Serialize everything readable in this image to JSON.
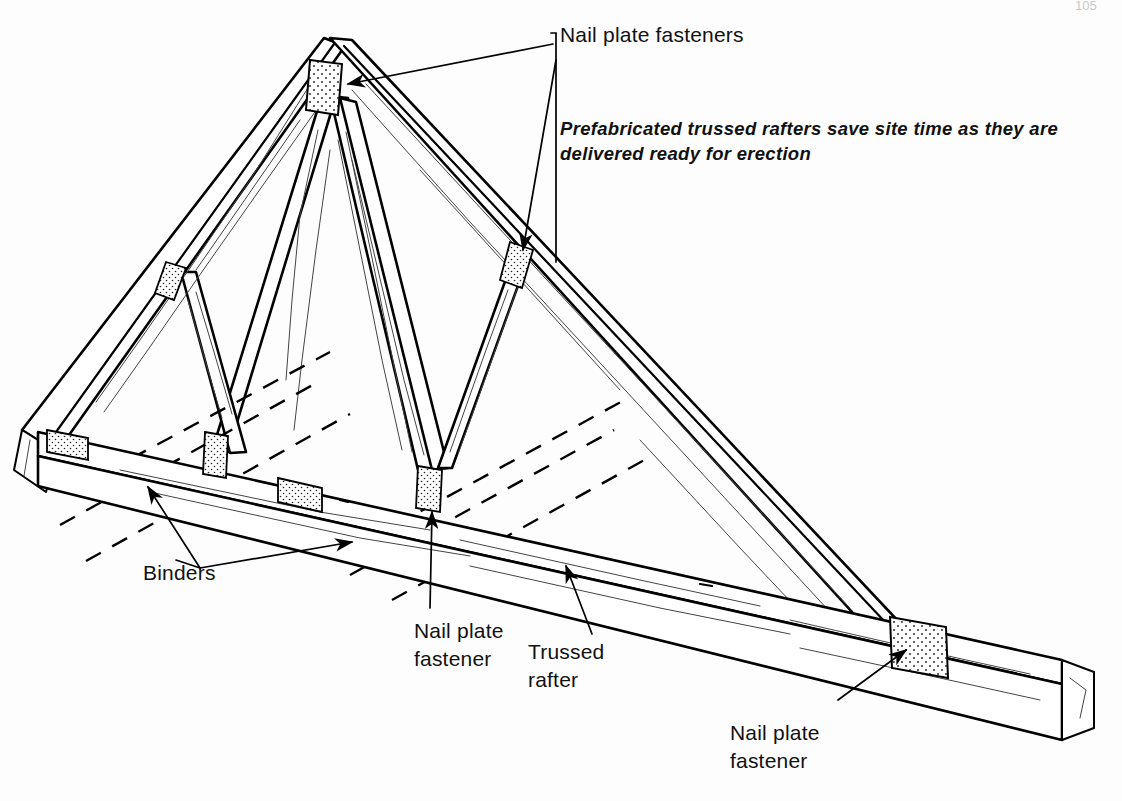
{
  "figure": {
    "page_number": "105",
    "line_color": "#000000",
    "background_color": "#ffffff",
    "grain_color": "#444444"
  },
  "caption": {
    "line1": "Prefabricated trussed rafters save site time as they are",
    "line2": "delivered ready for erection"
  },
  "labels": {
    "nail_plate_fasteners_top": "Nail plate fasteners",
    "binders": "Binders",
    "nail_plate_fastener_center_line1": "Nail plate",
    "nail_plate_fastener_center_line2": "fastener",
    "trussed_rafter_line1": "Trussed",
    "trussed_rafter_line2": "rafter",
    "nail_plate_fastener_right_line1": "Nail plate",
    "nail_plate_fastener_right_line2": "fastener"
  },
  "components": [
    {
      "id": "apex",
      "name": "Apex joint",
      "type": "nail-plate",
      "style": "vertical-stippled"
    },
    {
      "id": "left-rafter",
      "name": "Left rafter",
      "type": "timber"
    },
    {
      "id": "right-rafter",
      "name": "Right rafter",
      "type": "timber"
    },
    {
      "id": "tie-beam",
      "name": "Ceiling tie / bottom chord",
      "type": "timber"
    },
    {
      "id": "web-members",
      "name": "W-pattern web struts",
      "type": "timber",
      "count": 4
    },
    {
      "id": "binders",
      "name": "Binders",
      "type": "dashed-bands",
      "count": 3
    },
    {
      "id": "left-heel",
      "name": "Left heel joint nail plate",
      "type": "nail-plate"
    },
    {
      "id": "right-heel",
      "name": "Right heel joint nail plate",
      "type": "nail-plate"
    }
  ],
  "nail_plates": [
    {
      "id": "plate-apex",
      "location": "apex",
      "orientation": "vertical"
    },
    {
      "id": "plate-left-rafter-web",
      "location": "left rafter at upper web",
      "orientation": "angled"
    },
    {
      "id": "plate-right-rafter-web",
      "location": "right rafter at upper web",
      "orientation": "angled"
    },
    {
      "id": "plate-left-heel",
      "location": "left heel / eaves",
      "orientation": "flat"
    },
    {
      "id": "plate-tie-left-web",
      "location": "tie beam at left web foot",
      "orientation": "vertical"
    },
    {
      "id": "plate-tie-mid",
      "location": "tie beam mid span top face",
      "orientation": "flat"
    },
    {
      "id": "plate-tie-center",
      "location": "tie beam at centre web foot",
      "orientation": "vertical"
    },
    {
      "id": "plate-right-heel",
      "location": "right heel joint",
      "orientation": "flat"
    }
  ]
}
